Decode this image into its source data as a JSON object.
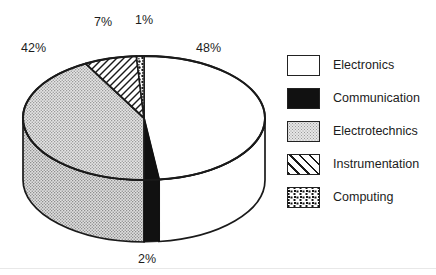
{
  "chart_data": {
    "type": "pie",
    "title": "",
    "subtitle": "",
    "xlabel": "",
    "ylabel": "",
    "categories": [
      "Electronics",
      "Communication",
      "Electrotechnics",
      "Instrumentation",
      "Computing"
    ],
    "values": [
      48,
      2,
      42,
      7,
      1
    ],
    "value_unit": "%",
    "data_labels": [
      "48%",
      "2%",
      "42%",
      "7%",
      "1%"
    ],
    "legend_position": "right",
    "grid": false,
    "three_d": true,
    "start_angle_deg": 0,
    "direction": "clockwise",
    "slice_patterns": [
      "solid-white",
      "solid-black",
      "fine-dot-gray",
      "diagonal-hatch",
      "coarse-speckle"
    ],
    "slices": [
      {
        "label": "Electronics",
        "value": 48,
        "data_label": "48%",
        "pattern": "solid-white"
      },
      {
        "label": "Communication",
        "value": 2,
        "data_label": "2%",
        "pattern": "solid-black"
      },
      {
        "label": "Electrotechnics",
        "value": 42,
        "data_label": "42%",
        "pattern": "fine-dot-gray"
      },
      {
        "label": "Instrumentation",
        "value": 7,
        "data_label": "7%",
        "pattern": "diagonal-hatch"
      },
      {
        "label": "Computing",
        "value": 1,
        "data_label": "1%",
        "pattern": "coarse-speckle"
      }
    ]
  },
  "labels": {
    "electronics_pct": "48%",
    "communication_pct": "2%",
    "electrotechnics_pct": "42%",
    "instrumentation_pct": "7%",
    "computing_pct": "1%"
  },
  "legend": {
    "items": [
      {
        "label": "Electronics",
        "pattern": "solid-white"
      },
      {
        "label": "Communication",
        "pattern": "solid-black"
      },
      {
        "label": "Electrotechnics",
        "pattern": "fine-dot-gray"
      },
      {
        "label": "Instrumentation",
        "pattern": "diagonal-hatch"
      },
      {
        "label": "Computing",
        "pattern": "coarse-speckle"
      }
    ]
  },
  "colors": {
    "outline": "#1a1a1a",
    "electronics_fill": "#ffffff",
    "communication_fill": "#111111",
    "electrotechnics_fill": "#d4d4d4",
    "instrumentation_fill": "#ffffff",
    "computing_fill": "#ffffff",
    "side_shadow": "#c9c9c9",
    "background": "#ffffff"
  }
}
